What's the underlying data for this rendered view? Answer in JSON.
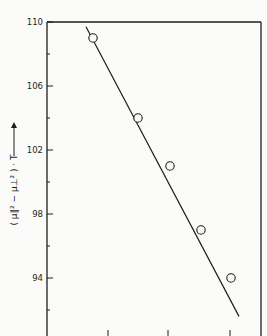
{
  "header": {
    "text": "TEMPERATURE DEPENDENCE OF MAGNETIC ANISOTROPY (cropped)"
  },
  "chart_data": {
    "type": "scatter",
    "title": "",
    "xlabel": "",
    "ylabel": "( μ∥² − μ⊥² ) · T",
    "ylabel_arrow": "→",
    "yticks": [
      110,
      106,
      102,
      98,
      94
    ],
    "ylim": [
      90.2,
      110
    ],
    "grid": false,
    "legend": null,
    "series": [
      {
        "name": "measured",
        "marker": "open-circle",
        "x": [
          1,
          2,
          3,
          4,
          5
        ],
        "y": [
          109.0,
          104.0,
          101.0,
          97.0,
          94.0
        ]
      }
    ],
    "fit_line": {
      "y_start": 109.7,
      "y_end": 91.6,
      "description": "linear fit, negative slope"
    }
  },
  "colors": {
    "ink": "#1e1e1e",
    "paper": "#fbfbf9"
  }
}
